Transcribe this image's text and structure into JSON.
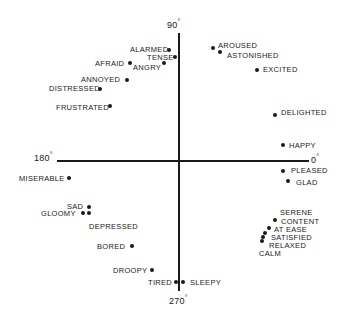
{
  "diagram": {
    "title": "",
    "axes": {
      "top": "90",
      "left": "180",
      "right": "0",
      "bottom": "270",
      "degree_symbol": "°"
    },
    "points": [
      {
        "id": "alarmed",
        "label": "ALARMED",
        "x": 169,
        "y": 50,
        "lx": 130,
        "ly": 45,
        "align": "left"
      },
      {
        "id": "tense",
        "label": "TENSE",
        "x": 175,
        "y": 57,
        "lx": 147,
        "ly": 53,
        "align": "left"
      },
      {
        "id": "angry",
        "label": "ANGRY",
        "x": 164,
        "y": 63,
        "lx": 133,
        "ly": 63,
        "align": "left"
      },
      {
        "id": "afraid",
        "label": "AFRAID",
        "x": 130,
        "y": 63,
        "lx": 95,
        "ly": 59,
        "align": "left"
      },
      {
        "id": "annoyed",
        "label": "ANNOYED",
        "x": 127,
        "y": 80,
        "lx": 81,
        "ly": 75,
        "align": "left"
      },
      {
        "id": "distressed",
        "label": "DISTRESSED",
        "x": 100,
        "y": 89,
        "lx": 49,
        "ly": 84,
        "align": "left"
      },
      {
        "id": "frustrated",
        "label": "FRUSTRATED",
        "x": 110,
        "y": 106,
        "lx": 56,
        "ly": 103,
        "align": "left"
      },
      {
        "id": "aroused",
        "label": "AROUSED",
        "x": 213,
        "y": 48,
        "lx": 218,
        "ly": 41,
        "align": "left"
      },
      {
        "id": "astonished",
        "label": "ASTONISHED",
        "x": 220,
        "y": 52,
        "lx": 227,
        "ly": 51,
        "align": "left"
      },
      {
        "id": "excited",
        "label": "EXCITED",
        "x": 257,
        "y": 70,
        "lx": 263,
        "ly": 65,
        "align": "left"
      },
      {
        "id": "delighted",
        "label": "DELIGHTED",
        "x": 275,
        "y": 115,
        "lx": 281,
        "ly": 108,
        "align": "left"
      },
      {
        "id": "happy",
        "label": "HAPPY",
        "x": 283,
        "y": 145,
        "lx": 289,
        "ly": 141,
        "align": "left"
      },
      {
        "id": "pleased",
        "label": "PLEASED",
        "x": 283,
        "y": 171,
        "lx": 291,
        "ly": 166,
        "align": "left"
      },
      {
        "id": "glad",
        "label": "GLAD",
        "x": 288,
        "y": 181,
        "lx": 296,
        "ly": 178,
        "align": "left"
      },
      {
        "id": "serene",
        "label": "SERENE",
        "x": 0,
        "y": 0,
        "lx": 280,
        "ly": 208,
        "align": "left",
        "no_dot": true
      },
      {
        "id": "content",
        "label": "CONTENT",
        "x": 275,
        "y": 220,
        "lx": 281,
        "ly": 217,
        "align": "left"
      },
      {
        "id": "at_ease",
        "label": "AT EASE",
        "x": 269,
        "y": 228,
        "lx": 274,
        "ly": 225,
        "align": "left"
      },
      {
        "id": "satisfied",
        "label": "SATISFIED",
        "x": 265,
        "y": 233,
        "lx": 271,
        "ly": 233,
        "align": "left"
      },
      {
        "id": "relaxed",
        "label": "RELAXED",
        "x": 263,
        "y": 237,
        "lx": 269,
        "ly": 241,
        "align": "left"
      },
      {
        "id": "calm",
        "label": "CALM",
        "x": 262,
        "y": 241,
        "lx": 259,
        "ly": 249,
        "align": "left"
      },
      {
        "id": "sleepy",
        "label": "SLEEPY",
        "x": 183,
        "y": 282,
        "lx": 190,
        "ly": 278,
        "align": "left"
      },
      {
        "id": "tired",
        "label": "TIRED",
        "x": 176,
        "y": 282,
        "lx": 148,
        "ly": 278,
        "align": "left"
      },
      {
        "id": "droopy",
        "label": "DROOPY",
        "x": 152,
        "y": 270,
        "lx": 113,
        "ly": 266,
        "align": "left"
      },
      {
        "id": "bored",
        "label": "BORED",
        "x": 132,
        "y": 246,
        "lx": 97,
        "ly": 242,
        "align": "left"
      },
      {
        "id": "depressed",
        "label": "DEPRESSED",
        "x": 0,
        "y": 0,
        "lx": 89,
        "ly": 222,
        "align": "left",
        "no_dot": true
      },
      {
        "id": "sad",
        "label": "SAD",
        "x": 89,
        "y": 207,
        "lx": 67,
        "ly": 202,
        "align": "left"
      },
      {
        "id": "gloomy",
        "label": "GLOOMY",
        "x": 89,
        "y": 213,
        "lx": 41,
        "ly": 209,
        "align": "left"
      },
      {
        "id": "gloomy2",
        "label": "",
        "x": 83,
        "y": 213,
        "lx": 0,
        "ly": 0,
        "align": "left"
      },
      {
        "id": "miserable",
        "label": "MISERABLE",
        "x": 69,
        "y": 178,
        "lx": 19,
        "ly": 174,
        "align": "left"
      }
    ]
  },
  "colors": {
    "ink": "#1a1a1a",
    "background": "#ffffff"
  }
}
